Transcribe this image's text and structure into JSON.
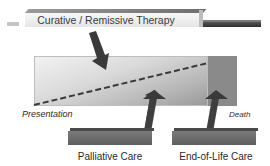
{
  "diagram": {
    "curative": {
      "label": "Curative / Remissive Therapy"
    },
    "timeline": {
      "start_label": "Presentation",
      "end_label": "Death"
    },
    "palliative": {
      "label": "Palliative Care"
    },
    "end_of_life": {
      "label": "End-of-Life Care"
    },
    "colors": {
      "arrow": "#3a3a3a",
      "bar": "#6e6e6e",
      "dashed_line": "#3a3a3a",
      "death_zone": "#8a8a8a"
    }
  }
}
